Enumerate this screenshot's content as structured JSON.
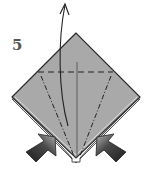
{
  "diagram": {
    "type": "origami-step",
    "step_number": "5",
    "colors": {
      "paper_fill": "#a9a9a9",
      "paper_edge": "#2b2b2b",
      "back_layer": "#e8e8e8",
      "fold_line": "#222222",
      "crease_line": "#555555",
      "arrow_dark": "#1e1e1e",
      "arrow_light": "#8a8a8a",
      "label": "#555555"
    },
    "elements": [
      {
        "id": "paper-diamond",
        "kind": "square-rotated-45",
        "top": [
          76,
          33
        ],
        "left": [
          12,
          97
        ],
        "right": [
          140,
          97
        ],
        "bottom": [
          76,
          161
        ]
      },
      {
        "id": "valley-fold",
        "kind": "dashed-line",
        "from": [
          38,
          72
        ],
        "to": [
          113,
          72
        ]
      },
      {
        "id": "center-crease",
        "kind": "solid-line",
        "from": [
          77,
          62
        ],
        "to": [
          77,
          158
        ]
      },
      {
        "id": "mountain-fold-left",
        "kind": "dash-dot-line",
        "from": [
          41,
          76
        ],
        "to": [
          74,
          156
        ]
      },
      {
        "id": "mountain-fold-right",
        "kind": "dash-dot-line",
        "from": [
          111,
          76
        ],
        "to": [
          80,
          156
        ]
      },
      {
        "id": "lift-arrow",
        "kind": "curved-arrow-up",
        "from": [
          68,
          125
        ],
        "to": [
          65,
          4
        ]
      },
      {
        "id": "push-arrow-left",
        "kind": "push-arrow",
        "direction": "up-right",
        "tip": [
          54,
          142
        ]
      },
      {
        "id": "push-arrow-right",
        "kind": "push-arrow",
        "direction": "up-left",
        "tip": [
          98,
          142
        ]
      }
    ]
  }
}
